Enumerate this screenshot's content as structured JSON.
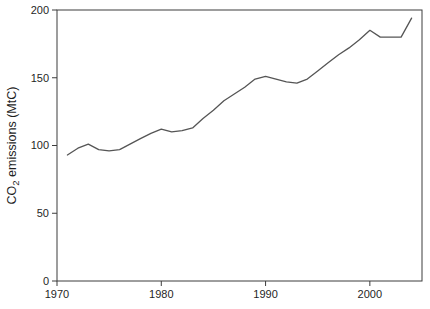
{
  "figure": {
    "background": "#ffffff",
    "axis_color": "#3c3c3c",
    "text_color": "#1f1f1f"
  },
  "chart_data": {
    "type": "line",
    "title": "",
    "xlabel": "",
    "ylabel": "CO2 emissions (MtC)",
    "ylabel_rich": [
      {
        "text": "CO",
        "style": "normal"
      },
      {
        "text": "2",
        "style": "subscript"
      },
      {
        "text": " emissions (MtC)",
        "style": "normal"
      }
    ],
    "x": [
      1971,
      1972,
      1973,
      1974,
      1975,
      1976,
      1977,
      1978,
      1979,
      1980,
      1981,
      1982,
      1983,
      1984,
      1985,
      1986,
      1987,
      1988,
      1989,
      1990,
      1991,
      1992,
      1993,
      1994,
      1995,
      1996,
      1997,
      1998,
      1999,
      2000,
      2001,
      2002,
      2003,
      2004
    ],
    "series": [
      {
        "name": "CO2 emissions",
        "color": "#555555",
        "values": [
          93,
          98,
          101,
          97,
          96,
          97,
          101,
          105,
          109,
          112,
          110,
          111,
          113,
          120,
          126,
          133,
          138,
          143,
          149,
          151,
          149,
          147,
          146,
          149,
          155,
          161,
          167,
          172,
          178,
          185,
          180,
          180,
          180,
          194
        ]
      }
    ],
    "xlim": [
      1970,
      2005
    ],
    "ylim": [
      0,
      200
    ],
    "xticks": [
      1970,
      1980,
      1990,
      2000
    ],
    "yticks": [
      0,
      50,
      100,
      150,
      200
    ],
    "grid": false,
    "legend": false,
    "frame": "box"
  }
}
